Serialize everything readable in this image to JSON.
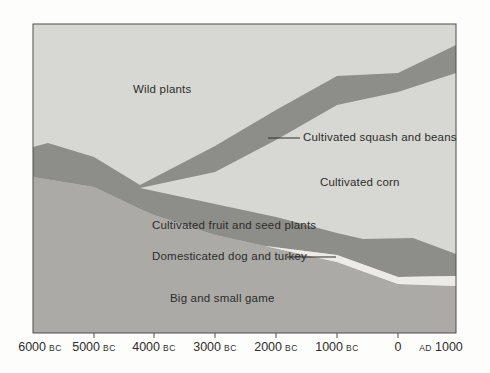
{
  "colors": {
    "background_page": "#fdfdfb",
    "plot_background": "#d7d7d4",
    "cultivated_band": "#8d8d8a",
    "game_area": "#abaaa7",
    "dog_turkey_band": "#ecebe7",
    "border": "#4f4f4d",
    "text": "#2d2d2b"
  },
  "labels": {
    "wild_plants": "Wild plants",
    "squash_beans": "Cultivated squash and beans",
    "corn": "Cultivated corn",
    "fruit_seed": "Cultivated fruit and seed plants",
    "dog_turkey": "Domesticated dog and turkey",
    "game": "Big and small game"
  },
  "chart_data": {
    "type": "area",
    "title": "",
    "xlabel": "",
    "ylabel": "",
    "grid": false,
    "legend": "labels placed inside areas with leader lines",
    "x_years": [
      -6000,
      -5000,
      -4000,
      -3000,
      -2000,
      -1000,
      0,
      1000
    ],
    "x_tick_label_texts": [
      "6000 BC",
      "5000 BC",
      "4000 BC",
      "3000 BC",
      "2000 BC",
      "1000 BC",
      "0",
      "AD 1000"
    ],
    "composition_pct_bottom_to_top": [
      {
        "name": "Big and small game",
        "pct": [
          50,
          47,
          38,
          32,
          28,
          23,
          16,
          15
        ]
      },
      {
        "name": "Domesticated dog and turkey",
        "pct": [
          0,
          0,
          0,
          0,
          1,
          2,
          2,
          3
        ]
      },
      {
        "name": "Cultivated fruit and seed plants",
        "pct": [
          10,
          10,
          8,
          10,
          10,
          7,
          12,
          7
        ]
      },
      {
        "name": "Cultivated corn",
        "pct": [
          0,
          0,
          3,
          10,
          25,
          41,
          47,
          59
        ]
      },
      {
        "name": "Cultivated squash and beans",
        "pct": [
          0,
          0,
          2,
          9,
          10,
          9,
          6,
          9
        ]
      },
      {
        "name": "Wild plants",
        "pct": [
          40,
          43,
          49,
          39,
          26,
          18,
          17,
          7
        ]
      }
    ],
    "geometry": {
      "canvas": {
        "w": 490,
        "h": 373
      },
      "plot": {
        "x": 33,
        "y": 24,
        "w": 423,
        "h": 309
      },
      "polygons": [
        {
          "name": "big-small-game-area",
          "color_key": "game_area",
          "points": [
            [
              33,
              177
            ],
            [
              94,
              187
            ],
            [
              140,
              209
            ],
            [
              154,
              215
            ],
            [
              215,
              235
            ],
            [
              265,
              246
            ],
            [
              337,
              262
            ],
            [
              398,
              284
            ],
            [
              456,
              286
            ],
            [
              456,
              333
            ],
            [
              33,
              333
            ]
          ]
        },
        {
          "name": "cultivated-bands-polygon",
          "color_key": "cultivated_band",
          "points": [
            [
              33,
              147
            ],
            [
              48,
              143
            ],
            [
              94,
              157
            ],
            [
              140,
              185
            ],
            [
              215,
              146
            ],
            [
              276,
              110
            ],
            [
              337,
              76
            ],
            [
              398,
              73
            ],
            [
              456,
              45
            ],
            [
              456,
              73
            ],
            [
              398,
              92
            ],
            [
              337,
              105
            ],
            [
              276,
              140
            ],
            [
              215,
              172
            ],
            [
              140,
              188
            ],
            [
              215,
              204
            ],
            [
              276,
              217
            ],
            [
              337,
              233
            ],
            [
              363,
              239
            ],
            [
              413,
              238
            ],
            [
              456,
              254
            ],
            [
              456,
              276
            ],
            [
              398,
              277
            ],
            [
              337,
              255
            ],
            [
              265,
              246
            ],
            [
              215,
              235
            ],
            [
              154,
              215
            ],
            [
              140,
              209
            ],
            [
              94,
              187
            ],
            [
              33,
              177
            ]
          ]
        },
        {
          "name": "dog-turkey-band",
          "color_key": "dog_turkey_band",
          "points": [
            [
              265,
              246
            ],
            [
              337,
              255
            ],
            [
              398,
              277
            ],
            [
              456,
              276
            ],
            [
              456,
              286
            ],
            [
              398,
              284
            ],
            [
              337,
              262
            ]
          ]
        }
      ],
      "leader_lines": [
        {
          "name": "squash-leader-line",
          "x1": 268,
          "y1": 138,
          "x2": 300,
          "y2": 138
        },
        {
          "name": "dog-turkey-leader-line",
          "x1": 287,
          "y1": 257,
          "x2": 336,
          "y2": 257
        }
      ],
      "tick_marks": {
        "xs": [
          94,
          154,
          215,
          276,
          337,
          398
        ],
        "y1": 333,
        "y2": 338
      },
      "tick_labels": [
        {
          "text": "6000",
          "era": "BC",
          "era_position": "after",
          "x": 40
        },
        {
          "text": "5000",
          "era": "BC",
          "era_position": "after",
          "x": 94
        },
        {
          "text": "4000",
          "era": "BC",
          "era_position": "after",
          "x": 154
        },
        {
          "text": "3000",
          "era": "BC",
          "era_position": "after",
          "x": 215
        },
        {
          "text": "2000",
          "era": "BC",
          "era_position": "after",
          "x": 276
        },
        {
          "text": "1000",
          "era": "BC",
          "era_position": "after",
          "x": 337
        },
        {
          "text": "0",
          "era": "",
          "era_position": "none",
          "x": 398
        },
        {
          "text": "1000",
          "era": "AD",
          "era_position": "before",
          "x": 441
        }
      ]
    }
  }
}
